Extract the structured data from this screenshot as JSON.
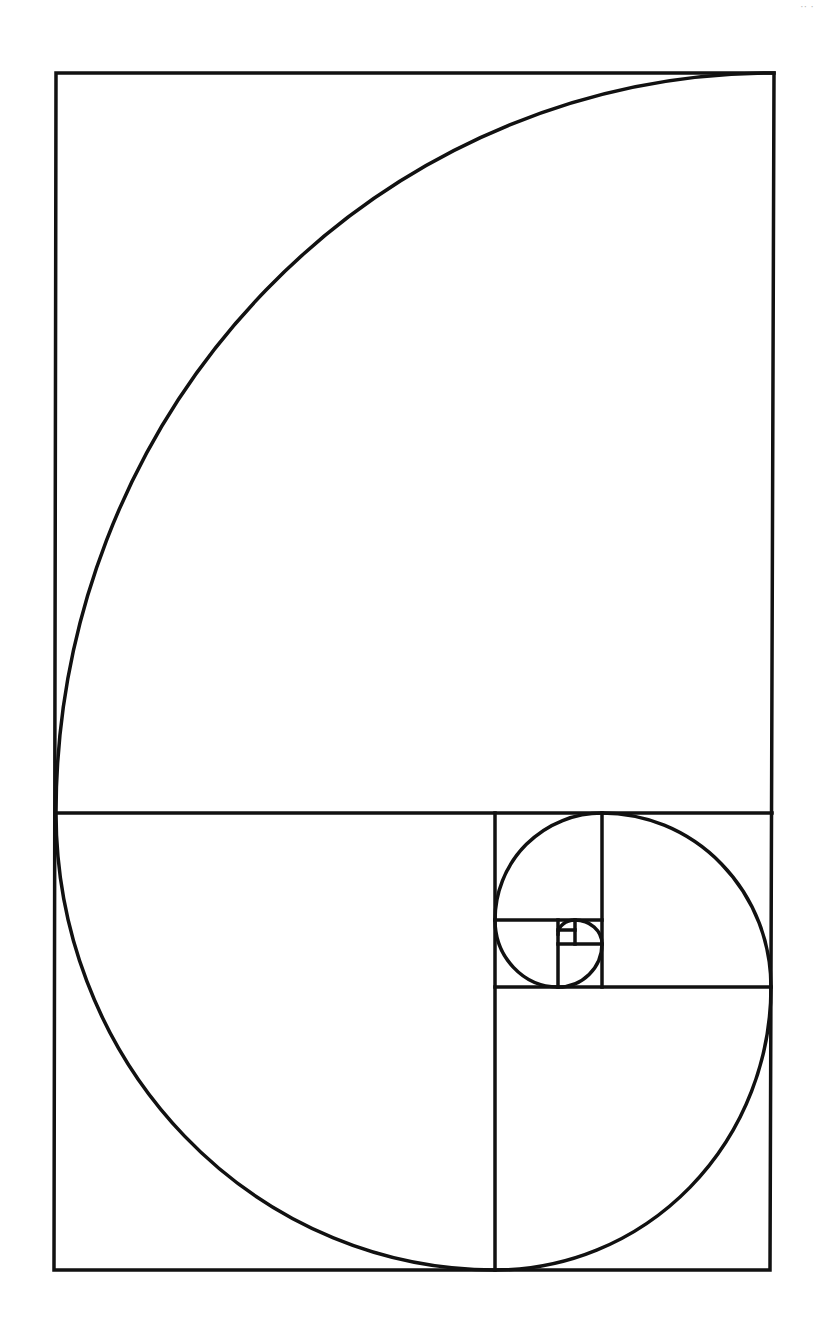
{
  "diagram": {
    "stroke_color": "#111111",
    "background": "#ffffff",
    "corner_text": "·· ·"
  }
}
